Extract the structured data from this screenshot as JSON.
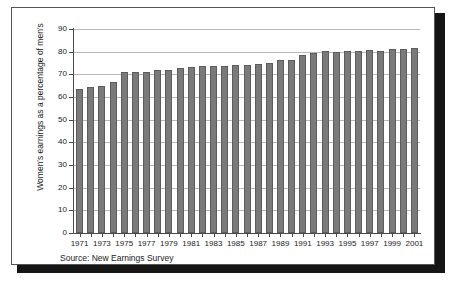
{
  "figure": {
    "source_note": "Source: New Earnings Survey",
    "frame_border_color": "#555555",
    "shadow_color": "#151515",
    "background": "#ffffff"
  },
  "chart_data": {
    "type": "bar",
    "title": "",
    "subtitle": "",
    "xlabel": "",
    "ylabel": "Women's earnings as a percentage of men's",
    "ylim": [
      0,
      90
    ],
    "ytick_labels": [
      "0",
      "10",
      "20",
      "30",
      "40",
      "50",
      "60",
      "70",
      "80",
      "90"
    ],
    "ytick_values": [
      0,
      10,
      20,
      30,
      40,
      50,
      60,
      70,
      80,
      90
    ],
    "grid": true,
    "grid_axis": "y",
    "legend": "none",
    "bar_color": "#7a7a7a",
    "bar_edge_color": "#5c5c5c",
    "categories": [
      "1971",
      "1972",
      "1973",
      "1974",
      "1975",
      "1976",
      "1977",
      "1978",
      "1979",
      "1980",
      "1981",
      "1982",
      "1983",
      "1984",
      "1985",
      "1986",
      "1987",
      "1988",
      "1989",
      "1990",
      "1991",
      "1992",
      "1993",
      "1994",
      "1995",
      "1996",
      "1997",
      "1998",
      "1999",
      "2000",
      "2001"
    ],
    "xtick_labels_shown": [
      "1971",
      "1973",
      "1975",
      "1977",
      "1979",
      "1981",
      "1983",
      "1985",
      "1987",
      "1989",
      "1991",
      "1993",
      "1995",
      "1997",
      "1999",
      "2001"
    ],
    "values": [
      63.7,
      64.2,
      64.8,
      66.6,
      70.9,
      71.2,
      71.2,
      72.0,
      72.1,
      72.6,
      73.4,
      73.5,
      73.5,
      73.5,
      74.0,
      74.0,
      74.5,
      75.1,
      76.3,
      76.4,
      78.4,
      79.3,
      80.1,
      80.0,
      80.1,
      80.1,
      80.6,
      80.1,
      81.4,
      81.4,
      81.5
    ]
  }
}
